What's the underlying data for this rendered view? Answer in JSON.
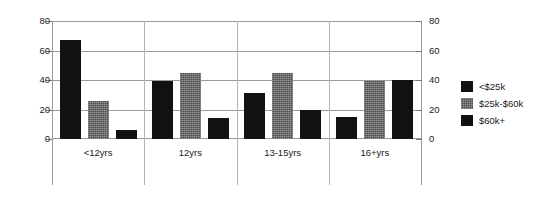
{
  "chart_data": {
    "type": "bar",
    "title": "",
    "xlabel": "",
    "ylabel": "",
    "ylim": [
      0,
      80
    ],
    "yticks": [
      0,
      20,
      40,
      60,
      80
    ],
    "ytick_labels": [
      "0",
      "20",
      "40",
      "60",
      "80"
    ],
    "dual_axis": true,
    "right_axis": {
      "ylim": [
        0,
        80
      ],
      "yticks": [
        0,
        20,
        40,
        60,
        80
      ],
      "ytick_labels": [
        "0",
        "20",
        "40",
        "60",
        "80"
      ]
    },
    "grid": true,
    "legend_position": "right",
    "categories": [
      "<12yrs",
      "12yrs",
      "13-15yrs",
      "16+yrs"
    ],
    "series": [
      {
        "name": "<$25k",
        "color": "#111111",
        "values": [
          67,
          39,
          31,
          15
        ]
      },
      {
        "name": "$25k-$60k",
        "color": "#4f4f4f",
        "values": [
          26,
          45,
          45,
          39
        ]
      },
      {
        "name": "$60k+",
        "color": "#111111",
        "values": [
          6,
          14,
          20,
          40
        ]
      }
    ]
  },
  "legend": {
    "items": [
      {
        "label": "<$25k"
      },
      {
        "label": "$25k-$60k"
      },
      {
        "label": "$60k+"
      }
    ]
  }
}
